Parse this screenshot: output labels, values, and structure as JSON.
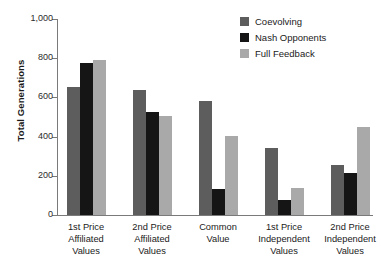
{
  "chart_data": {
    "type": "bar",
    "title": "",
    "xlabel": "",
    "ylabel": "Total Generations",
    "ylim": [
      0,
      1000
    ],
    "yticks": [
      "0",
      "200",
      "400",
      "600",
      "800",
      "1,000"
    ],
    "ytick_values": [
      0,
      200,
      400,
      600,
      800,
      1000
    ],
    "grid": false,
    "legend_position": "top-right",
    "categories": [
      "1st Price\nAffiliated\nValues",
      "2nd Price\nAffiliated\nValues",
      "Common\nValue",
      "1st Price\nIndependent\nValues",
      "2nd Price\nIndependent\nValues"
    ],
    "series": [
      {
        "name": "Coevolving",
        "color": "#5d5d5d",
        "values": [
          655,
          640,
          582,
          343,
          253
        ]
      },
      {
        "name": "Nash Opponents",
        "color": "#151515",
        "values": [
          778,
          525,
          132,
          75,
          212
        ]
      },
      {
        "name": "Full Feedback",
        "color": "#a9a9a9",
        "values": [
          790,
          505,
          405,
          137,
          448
        ]
      }
    ]
  },
  "axis": {
    "ylabel": "Total Generations",
    "ticks": [
      {
        "label": "1,000",
        "value": 1000
      },
      {
        "label": "800",
        "value": 800
      },
      {
        "label": "600",
        "value": 600
      },
      {
        "label": "400",
        "value": 400
      },
      {
        "label": "200",
        "value": 200
      },
      {
        "label": "0",
        "value": 0
      }
    ]
  },
  "categories": [
    {
      "line1": "1st Price",
      "line2": "Affiliated",
      "line3": "Values"
    },
    {
      "line1": "2nd Price",
      "line2": "Affiliated",
      "line3": "Values"
    },
    {
      "line1": "Common",
      "line2": "Value",
      "line3": ""
    },
    {
      "line1": "1st Price",
      "line2": "Independent",
      "line3": "Values"
    },
    {
      "line1": "2nd Price",
      "line2": "Independent",
      "line3": "Values"
    }
  ],
  "legend": {
    "items": [
      {
        "label": "Coevolving",
        "color": "#5d5d5d",
        "swatch": "legend-swatch-coevolving"
      },
      {
        "label": "Nash Opponents",
        "color": "#151515",
        "swatch": "legend-swatch-nash-opponents"
      },
      {
        "label": "Full Feedback",
        "color": "#a9a9a9",
        "swatch": "legend-swatch-full-feedback"
      }
    ]
  }
}
